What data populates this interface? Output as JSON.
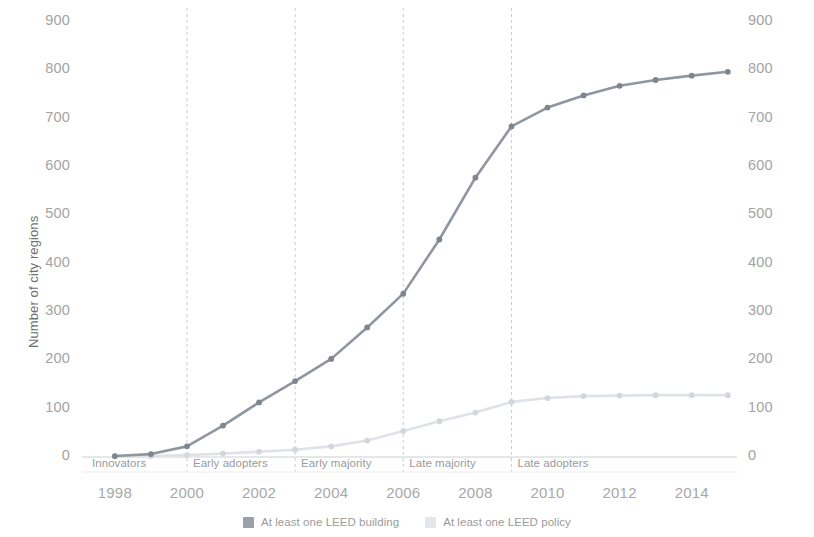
{
  "chart_data": {
    "type": "line",
    "title": "",
    "xlabel": "",
    "ylabel": "Number of city regions",
    "xlim": [
      1997.2,
      2015.2
    ],
    "ylim": [
      0,
      900
    ],
    "grid": false,
    "legend_position": "bottom-center",
    "x": [
      1998,
      1999,
      2000,
      2001,
      2002,
      2003,
      2004,
      2005,
      2006,
      2007,
      2008,
      2009,
      2010,
      2011,
      2012,
      2013,
      2014,
      2015
    ],
    "series": [
      {
        "name": "At least one LEED building",
        "color": "#8f96a0",
        "marker": "circle",
        "values": [
          2,
          6,
          22,
          65,
          113,
          157,
          203,
          268,
          338,
          450,
          578,
          684,
          723,
          748,
          768,
          780,
          789,
          797
        ]
      },
      {
        "name": "At least one LEED policy",
        "color": "#dfe2e6",
        "marker": "circle",
        "values": [
          1,
          2,
          4,
          7,
          11,
          15,
          22,
          34,
          54,
          74,
          92,
          114,
          122,
          126,
          127,
          128,
          128,
          128
        ]
      }
    ],
    "x_ticks": [
      1998,
      2000,
      2002,
      2004,
      2006,
      2008,
      2010,
      2012,
      2014
    ],
    "y_ticks": [
      0,
      100,
      200,
      300,
      400,
      500,
      600,
      700,
      800,
      900
    ],
    "y_ticks_right": [
      0,
      100,
      200,
      300,
      400,
      500,
      600,
      700,
      800,
      900
    ],
    "annotations": [
      {
        "label": "Innovators",
        "start": 1997.2,
        "end": 2000.0
      },
      {
        "label": "Early adopters",
        "start": 2000.0,
        "end": 2003.0
      },
      {
        "label": "Early majority",
        "start": 2003.0,
        "end": 2006.0
      },
      {
        "label": "Late majority",
        "start": 2006.0,
        "end": 2009.0
      },
      {
        "label": "Late adopters",
        "start": 2009.0,
        "end": 2015.2
      }
    ],
    "divider_years": [
      2000,
      2003,
      2006,
      2009
    ]
  },
  "axes": {
    "y_label_left": "Number of city regions",
    "y_ticks_left": [
      "900",
      "800",
      "700",
      "600",
      "500",
      "400",
      "300",
      "200",
      "100",
      "0"
    ],
    "y_ticks_right": [
      "900",
      "800",
      "700",
      "600",
      "500",
      "400",
      "300",
      "200",
      "100",
      "0"
    ],
    "x_ticks": [
      "1998",
      "2000",
      "2002",
      "2004",
      "2006",
      "2008",
      "2010",
      "2012",
      "2014"
    ]
  },
  "bands": {
    "items": [
      {
        "label": "Innovators"
      },
      {
        "label": "Early adopters"
      },
      {
        "label": "Early majority"
      },
      {
        "label": "Late majority"
      },
      {
        "label": "Late adopters"
      }
    ]
  },
  "legend": {
    "items": [
      {
        "label": "At least one LEED building",
        "color": "#9aa1ab"
      },
      {
        "label": "At least one LEED policy",
        "color": "#e3e6ea"
      }
    ]
  },
  "colors": {
    "series_building": "#8f96a0",
    "series_policy": "#dfe2e6",
    "axis_text": "#a3a3a3",
    "divider": "#c9ccd1",
    "baseline": "#dedfe2"
  }
}
